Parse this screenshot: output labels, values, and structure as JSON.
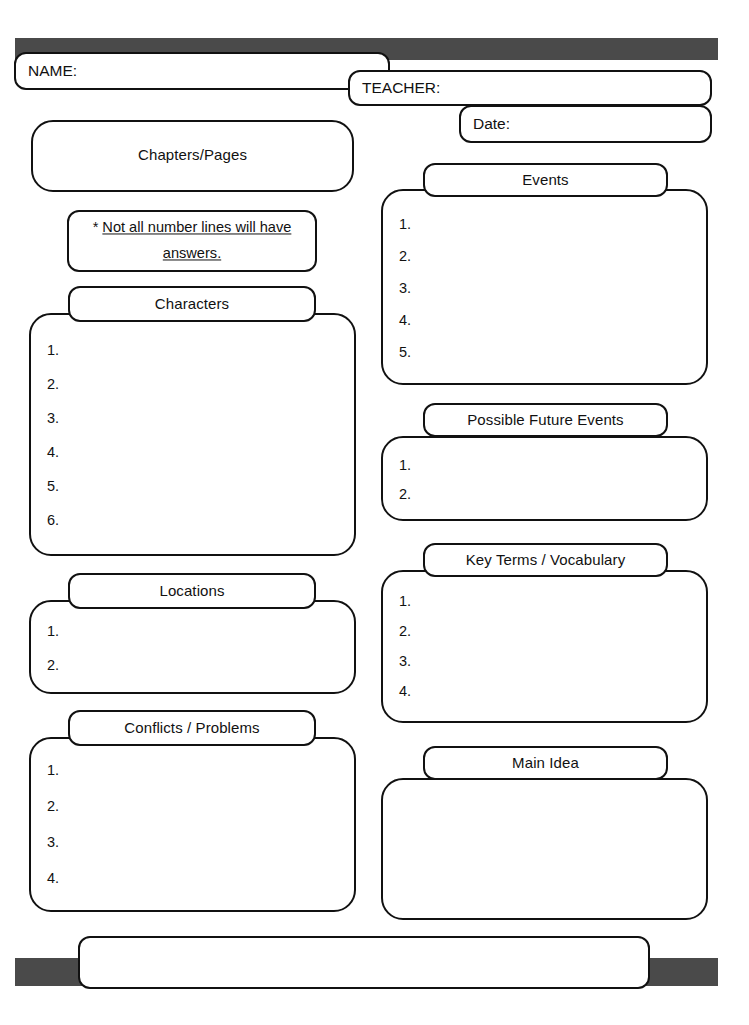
{
  "page": {
    "bar_color": "#4a4a4a",
    "line_color": "#111111",
    "background": "#ffffff"
  },
  "header": {
    "name_label": "NAME:",
    "teacher_label": "TEACHER:",
    "date_label": "Date:"
  },
  "note": {
    "asterisk": "* ",
    "text": "Not all number lines will have answers."
  },
  "left_column": {
    "chapters": {
      "title": "Chapters/Pages",
      "items": []
    },
    "characters": {
      "title": "Characters",
      "items": [
        "1.",
        "2.",
        "3.",
        "4.",
        "5.",
        "6."
      ]
    },
    "locations": {
      "title": "Locations",
      "items": [
        "1.",
        "2."
      ]
    },
    "conflicts": {
      "title": "Conflicts / Problems",
      "items": [
        "1.",
        "2.",
        "3.",
        "4."
      ]
    }
  },
  "right_column": {
    "events": {
      "title": "Events",
      "items": [
        "1.",
        "2.",
        "3.",
        "4.",
        "5."
      ]
    },
    "future_events": {
      "title": "Possible Future Events",
      "items": [
        "1.",
        "2."
      ]
    },
    "key_terms": {
      "title": "Key Terms / Vocabulary",
      "items": [
        "1.",
        "2.",
        "3.",
        "4."
      ]
    },
    "main_idea": {
      "title": "Main Idea",
      "items": []
    }
  },
  "footer": {
    "note_label": ""
  }
}
